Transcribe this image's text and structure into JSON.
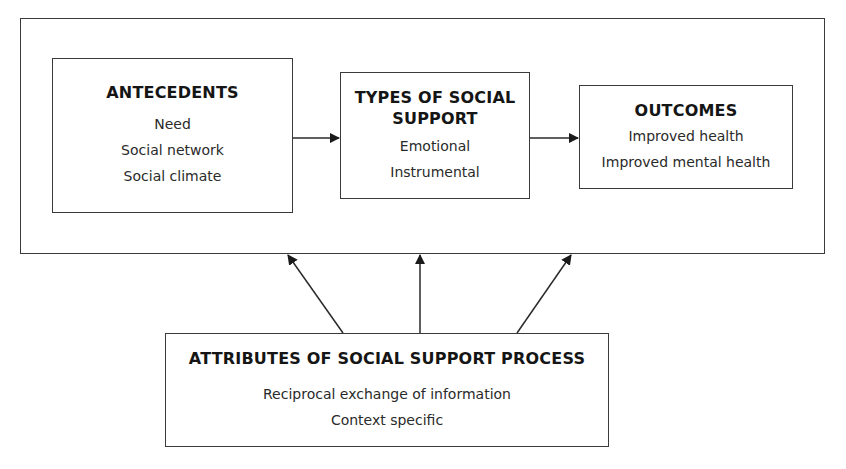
{
  "diagram": {
    "antecedents": {
      "title": "ANTECEDENTS",
      "items": [
        "Need",
        "Social network",
        "Social climate"
      ]
    },
    "types": {
      "title_line1": "TYPES OF SOCIAL",
      "title_line2": "SUPPORT",
      "items": [
        "Emotional",
        "Instrumental"
      ]
    },
    "outcomes": {
      "title": "OUTCOMES",
      "items": [
        "Improved health",
        "Improved mental health"
      ]
    },
    "attributes": {
      "title": "ATTRIBUTES OF SOCIAL SUPPORT PROCESS",
      "items": [
        "Reciprocal exchange of information",
        "Context specific"
      ]
    },
    "edges": [
      {
        "from": "antecedents",
        "to": "types"
      },
      {
        "from": "types",
        "to": "outcomes"
      },
      {
        "from": "attributes",
        "to": "outer-frame",
        "direction": "up-left"
      },
      {
        "from": "attributes",
        "to": "outer-frame",
        "direction": "up"
      },
      {
        "from": "attributes",
        "to": "outer-frame",
        "direction": "up-right"
      }
    ],
    "colors": {
      "stroke": "#3a3a3a",
      "text": "#1a1a1a",
      "background": "#ffffff"
    }
  }
}
